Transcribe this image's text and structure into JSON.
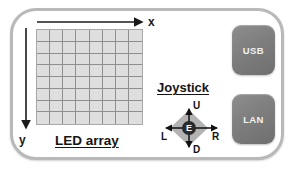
{
  "diagram": {
    "frame": {
      "name": "device-outline",
      "border_color": "#b9b9b9",
      "background_color": "#ffffff"
    },
    "led_array": {
      "caption": "LED array",
      "rows": 8,
      "columns": 8,
      "cell_fill": "#dedede",
      "grid_line_color": "#8f8f8f"
    },
    "axes": {
      "x": {
        "label": "x",
        "direction": "right",
        "icon": "arrow-right-icon"
      },
      "y": {
        "label": "y",
        "direction": "down",
        "icon": "arrow-down-icon"
      },
      "color": "#1a1a1a"
    },
    "joystick": {
      "caption": "Joystick",
      "diamond_fill": "#b3b3b3",
      "center": {
        "label": "E",
        "meaning": "enter",
        "fill": "#2b2b2b",
        "text_color": "#ffffff"
      },
      "directions": [
        {
          "label": "U",
          "meaning": "up",
          "position": "top"
        },
        {
          "label": "D",
          "meaning": "down",
          "position": "bottom"
        },
        {
          "label": "L",
          "meaning": "left",
          "position": "left"
        },
        {
          "label": "R",
          "meaning": "right",
          "position": "right"
        }
      ]
    },
    "ports": [
      {
        "label": "USB",
        "name": "usb-port-button",
        "color": "#7e7e7e"
      },
      {
        "label": "LAN",
        "name": "lan-port-button",
        "color": "#7e7e7e"
      }
    ]
  }
}
